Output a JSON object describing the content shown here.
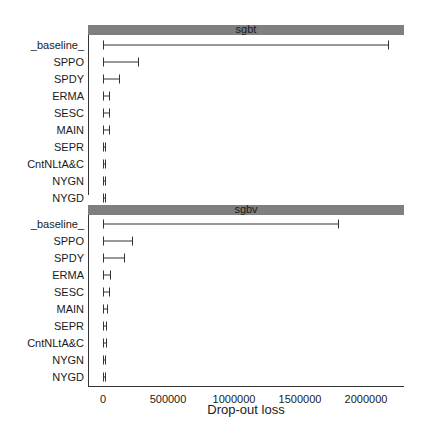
{
  "chart_data": [
    {
      "type": "bar",
      "title": "sgbt",
      "xlabel": "Drop-out loss",
      "ylabel": "",
      "xlim": [
        -100000,
        2300000
      ],
      "categories": [
        "_baseline_",
        "SPPO",
        "SPDY",
        "ERMA",
        "SESC",
        "MAIN",
        "SEPR",
        "CntNLtA&C",
        "NYGN",
        "NYGD"
      ],
      "values": [
        2170000,
        270000,
        130000,
        50000,
        50000,
        50000,
        25000,
        25000,
        25000,
        20000
      ]
    },
    {
      "type": "bar",
      "title": "sgbv",
      "xlabel": "Drop-out loss",
      "ylabel": "",
      "xlim": [
        -100000,
        2300000
      ],
      "categories": [
        "_baseline_",
        "SPPO",
        "SPDY",
        "ERMA",
        "SESC",
        "MAIN",
        "SEPR",
        "CntNLtA&C",
        "NYGN",
        "NYGD"
      ],
      "values": [
        1790000,
        230000,
        170000,
        60000,
        50000,
        40000,
        30000,
        30000,
        25000,
        20000
      ]
    }
  ],
  "panels": [
    {
      "title": "sgbt",
      "labels": [
        "_baseline_",
        "SPPO",
        "SPDY",
        "ERMA",
        "SESC",
        "MAIN",
        "SEPR",
        "CntNLtA&C",
        "NYGN",
        "NYGD"
      ]
    },
    {
      "title": "sgbv",
      "labels": [
        "_baseline_",
        "SPPO",
        "SPDY",
        "ERMA",
        "SESC",
        "MAIN",
        "SEPR",
        "CntNLtA&C",
        "NYGN",
        "NYGD"
      ]
    }
  ],
  "axis": {
    "ticks": [
      "0",
      "500000",
      "1000000",
      "1500000",
      "2000000"
    ],
    "label": "Drop-out loss"
  }
}
